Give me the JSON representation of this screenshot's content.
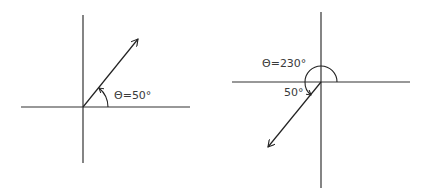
{
  "diagrams": [
    {
      "name": "vector-50-degrees",
      "angle_label": "Θ=50°",
      "angle_deg": 50,
      "color": "#222222"
    },
    {
      "name": "vector-230-degrees",
      "angle_label": "Θ=230°",
      "reference_angle_label": "50°",
      "angle_deg": 230,
      "reference_angle_deg": 50,
      "color": "#222222"
    }
  ]
}
